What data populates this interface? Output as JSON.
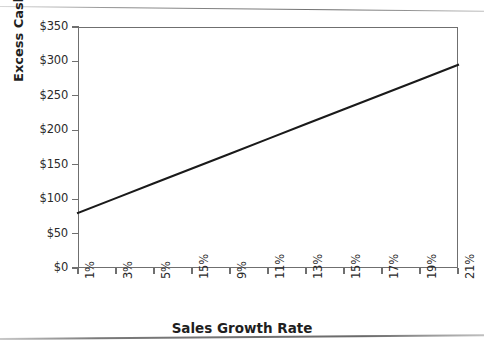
{
  "chart_data": {
    "type": "line",
    "title": "",
    "xlabel": "Sales Growth Rate",
    "ylabel": "Excess Cash",
    "categories": [
      "1%",
      "3%",
      "5%",
      "15%",
      "9%",
      "11%",
      "13%",
      "15%",
      "17%",
      "19%",
      "21%"
    ],
    "x_tick_labels": [
      "1%",
      "3%",
      "5%",
      "15%",
      "9%",
      "11%",
      "13%",
      "15%",
      "17%",
      "19%",
      "21%"
    ],
    "y_tick_labels": [
      "$0",
      "$50",
      "$100",
      "$150",
      "$200",
      "$250",
      "$300",
      "$350"
    ],
    "y_tick_values": [
      0,
      50,
      100,
      150,
      200,
      250,
      300,
      350
    ],
    "ylim": [
      0,
      350
    ],
    "series": [
      {
        "name": "Excess Cash",
        "values": [
          80,
          101.5,
          123,
          144.5,
          166,
          187.5,
          209,
          230.5,
          252,
          273.5,
          295
        ],
        "color": "#1a1a1a"
      }
    ],
    "grid": false,
    "legend": false,
    "legend_position": "none"
  },
  "axis": {
    "y_title": "Excess Cash",
    "x_title": "Sales Growth Rate"
  },
  "style": {
    "background": "#ffffff",
    "frame_color": "#6f6f6f",
    "line_color": "#1a1a1a",
    "text_color": "#2b2b2b"
  }
}
